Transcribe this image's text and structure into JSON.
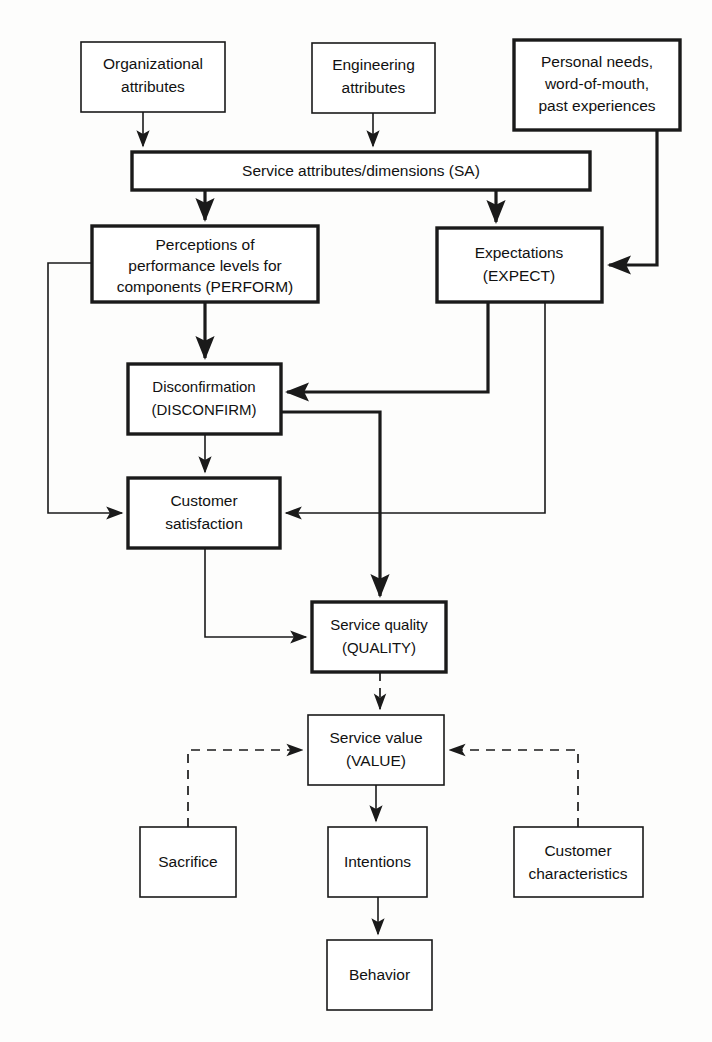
{
  "diagram": {
    "colors": {
      "background": "#fdfdfc",
      "stroke": "#1a1a1a",
      "node_fill": "#ffffff"
    },
    "nodes": [
      {
        "id": "organizational_attributes",
        "lines": [
          "Organizational",
          "attributes"
        ],
        "emphasis": "normal"
      },
      {
        "id": "engineering_attributes",
        "lines": [
          "Engineering",
          "attributes"
        ],
        "emphasis": "normal"
      },
      {
        "id": "personal_needs",
        "lines": [
          "Personal needs,",
          "word-of-mouth,",
          "past experiences"
        ],
        "emphasis": "bold"
      },
      {
        "id": "service_attributes",
        "lines": [
          "Service attributes/dimensions (SA)"
        ],
        "emphasis": "bold"
      },
      {
        "id": "perform",
        "lines": [
          "Perceptions of",
          "performance levels for",
          "components (PERFORM)"
        ],
        "emphasis": "bold"
      },
      {
        "id": "expect",
        "lines": [
          "Expectations",
          "(EXPECT)"
        ],
        "emphasis": "bold"
      },
      {
        "id": "disconfirm",
        "lines": [
          "Disconfirmation",
          "(DISCONFIRM)"
        ],
        "emphasis": "bold"
      },
      {
        "id": "customer_satisfaction",
        "lines": [
          "Customer",
          "satisfaction"
        ],
        "emphasis": "bold"
      },
      {
        "id": "quality",
        "lines": [
          "Service quality",
          "(QUALITY)"
        ],
        "emphasis": "bold"
      },
      {
        "id": "value",
        "lines": [
          "Service value",
          "(VALUE)"
        ],
        "emphasis": "normal"
      },
      {
        "id": "sacrifice",
        "lines": [
          "Sacrifice"
        ],
        "emphasis": "normal"
      },
      {
        "id": "intentions",
        "lines": [
          "Intentions"
        ],
        "emphasis": "normal"
      },
      {
        "id": "customer_characteristics",
        "lines": [
          "Customer",
          "characteristics"
        ],
        "emphasis": "normal"
      },
      {
        "id": "behavior",
        "lines": [
          "Behavior"
        ],
        "emphasis": "normal"
      }
    ],
    "edges": [
      {
        "from": "organizational_attributes",
        "to": "service_attributes",
        "style": "solid"
      },
      {
        "from": "engineering_attributes",
        "to": "service_attributes",
        "style": "solid"
      },
      {
        "from": "personal_needs",
        "to": "expect",
        "style": "solid"
      },
      {
        "from": "service_attributes",
        "to": "perform",
        "style": "solid"
      },
      {
        "from": "service_attributes",
        "to": "expect",
        "style": "solid"
      },
      {
        "from": "perform",
        "to": "disconfirm",
        "style": "solid"
      },
      {
        "from": "perform",
        "to": "customer_satisfaction",
        "style": "solid"
      },
      {
        "from": "expect",
        "to": "disconfirm",
        "style": "solid"
      },
      {
        "from": "expect",
        "to": "customer_satisfaction",
        "style": "solid"
      },
      {
        "from": "disconfirm",
        "to": "customer_satisfaction",
        "style": "solid"
      },
      {
        "from": "disconfirm",
        "to": "quality",
        "style": "solid"
      },
      {
        "from": "customer_satisfaction",
        "to": "quality",
        "style": "solid"
      },
      {
        "from": "quality",
        "to": "value",
        "style": "dashed"
      },
      {
        "from": "sacrifice",
        "to": "value",
        "style": "dashed"
      },
      {
        "from": "customer_characteristics",
        "to": "value",
        "style": "dashed"
      },
      {
        "from": "value",
        "to": "intentions",
        "style": "solid"
      },
      {
        "from": "intentions",
        "to": "behavior",
        "style": "solid"
      }
    ]
  }
}
